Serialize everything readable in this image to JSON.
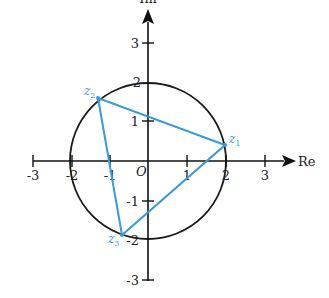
{
  "diagram": {
    "type": "complex-plane",
    "axes": {
      "x_label": "Re",
      "y_label": "Im",
      "origin_label": "O",
      "x_ticks": [
        {
          "value": -3,
          "label": "-3"
        },
        {
          "value": -2,
          "label": "-2"
        },
        {
          "value": -1,
          "label": "-1"
        },
        {
          "value": 1,
          "label": "1"
        },
        {
          "value": 2,
          "label": "2"
        },
        {
          "value": 3,
          "label": "3"
        }
      ],
      "y_ticks": [
        {
          "value": 3,
          "label": "3"
        },
        {
          "value": 2,
          "label": "2"
        },
        {
          "value": 1,
          "label": "1"
        },
        {
          "value": -1,
          "label": "-1"
        },
        {
          "value": -2,
          "label": "-2"
        },
        {
          "value": -3,
          "label": "-3"
        }
      ]
    },
    "circle": {
      "center": [
        0,
        0
      ],
      "radius": 2,
      "color": "#1a1a1a"
    },
    "points": [
      {
        "name": "z",
        "sub": "1",
        "re": 2.0,
        "im": 0.4
      },
      {
        "name": "z",
        "sub": "2",
        "re": -1.3,
        "im": 1.6
      },
      {
        "name": "z",
        "sub": "3",
        "re": -0.67,
        "im": -1.9
      }
    ],
    "triangle_color": "#3a9ad9",
    "axis_color": "#111111"
  }
}
